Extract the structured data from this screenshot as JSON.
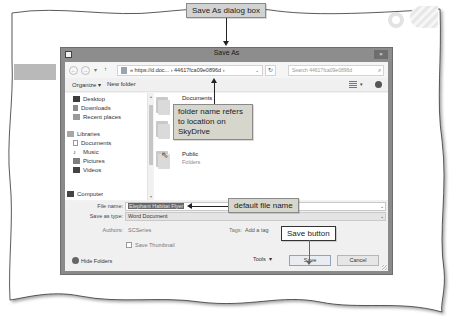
{
  "callouts": {
    "dialog_box": "Save As dialog box",
    "folder_name": "folder name refers to location on SkyDrive",
    "default_file_name": "default file name",
    "save_button": "Save button"
  },
  "dialog": {
    "title": "Save As",
    "close_label": "×",
    "address": {
      "back": "←",
      "forward": "→",
      "recent": "▾",
      "up": "↑",
      "path_prefix": "«",
      "path_segment_1": "https://d.doc...",
      "separator": "›",
      "path_segment_2": "44617fca09e0896d",
      "separator_2": "›",
      "dropdown": "⌄",
      "refresh": "↻"
    },
    "search": {
      "placeholder": "Search 44617fca09e0896d",
      "icon": "⌕"
    },
    "toolbar": {
      "organize": "Organize ▾",
      "new_folder": "New folder",
      "view_arrow": "▾"
    },
    "nav_pane": {
      "items": [
        {
          "label": "Desktop",
          "icon": "desktop-icon"
        },
        {
          "label": "Downloads",
          "icon": "downloads-icon"
        },
        {
          "label": "Recent places",
          "icon": "recent-places-icon"
        },
        {
          "label": "Libraries",
          "icon": "libraries-icon"
        },
        {
          "label": "Documents",
          "icon": "documents-icon"
        },
        {
          "label": "Music",
          "icon": "music-icon"
        },
        {
          "label": "Pictures",
          "icon": "pictures-icon"
        },
        {
          "label": "Videos",
          "icon": "videos-icon"
        },
        {
          "label": "Computer",
          "icon": "computer-icon"
        }
      ],
      "scroll_up": "▴",
      "scroll_down": "▾"
    },
    "content": {
      "folders": [
        {
          "name": "Documents",
          "sub": ""
        },
        {
          "name": "Public",
          "sub": "Folders"
        }
      ]
    },
    "fields": {
      "file_name_label": "File name:",
      "file_name_value": "Elephant Habitat Flyer",
      "save_as_type_label": "Save as type:",
      "save_as_type_value": "Word Document",
      "authors_label": "Authors:",
      "authors_value": "SCSeries",
      "tags_label": "Tags:",
      "tags_value": "Add a tag",
      "save_thumbnail_label": "Save Thumbnail",
      "dropdown_arrow": "⌄"
    },
    "footer": {
      "hide_folders": "Hide Folders",
      "tools": "Tools",
      "tools_arrow": "▾",
      "save": "Save",
      "cancel": "Cancel"
    }
  }
}
